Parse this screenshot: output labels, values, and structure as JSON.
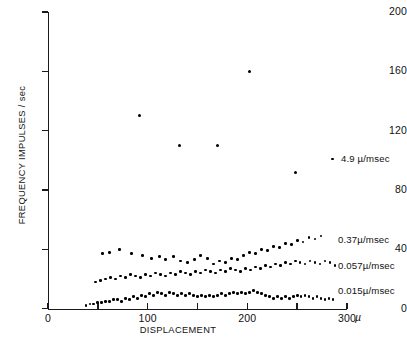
{
  "chart_data": {
    "type": "scatter",
    "title": "",
    "xlabel": "DISPLACEMENT",
    "ylabel": "FREQUENCY IMPULSES / sec",
    "xunit": "µ",
    "xlim": [
      0,
      300
    ],
    "ylim": [
      0,
      200
    ],
    "xticks": [
      0,
      50,
      100,
      150,
      200,
      250,
      300
    ],
    "xticklabels": [
      "0",
      "",
      "100",
      "",
      "200",
      "",
      "300"
    ],
    "yticks": [
      0,
      40,
      80,
      120,
      160,
      200
    ],
    "yticklabels": [
      "0",
      "40",
      "80",
      "120",
      "160",
      "200"
    ],
    "grid": false,
    "legend_position": "right-inline",
    "marker_color": "#000000",
    "series": [
      {
        "name": "4.9 µ/msec",
        "label": "4.9 µ/msec",
        "label_y": 101,
        "points": [
          [
            92,
            130
          ],
          [
            132,
            110
          ],
          [
            170,
            110
          ],
          [
            202,
            160
          ],
          [
            248,
            92
          ]
        ]
      },
      {
        "name": "0.37 µ/msec",
        "label": "0.37µ/msec",
        "label_y": 46,
        "points": [
          [
            55,
            37
          ],
          [
            62,
            38
          ],
          [
            72,
            40
          ],
          [
            84,
            37
          ],
          [
            95,
            36
          ],
          [
            104,
            34
          ],
          [
            112,
            35
          ],
          [
            118,
            33
          ],
          [
            126,
            35
          ],
          [
            133,
            32
          ],
          [
            140,
            31
          ],
          [
            147,
            33
          ],
          [
            153,
            36
          ],
          [
            160,
            34
          ],
          [
            166,
            30
          ],
          [
            172,
            32
          ],
          [
            178,
            31
          ],
          [
            184,
            34
          ],
          [
            190,
            33
          ],
          [
            196,
            36
          ],
          [
            202,
            38
          ],
          [
            208,
            37
          ],
          [
            214,
            40
          ],
          [
            220,
            39
          ],
          [
            226,
            42
          ],
          [
            232,
            41
          ],
          [
            238,
            44
          ],
          [
            244,
            43
          ],
          [
            250,
            46
          ],
          [
            256,
            45
          ],
          [
            262,
            48
          ],
          [
            268,
            47
          ],
          [
            274,
            49
          ]
        ]
      },
      {
        "name": "0.057 µ/msec",
        "label": "0.057µ/msec",
        "label_y": 29,
        "points": [
          [
            48,
            18
          ],
          [
            53,
            19
          ],
          [
            58,
            20
          ],
          [
            63,
            21
          ],
          [
            68,
            20
          ],
          [
            73,
            22
          ],
          [
            78,
            21
          ],
          [
            83,
            23
          ],
          [
            88,
            22
          ],
          [
            93,
            21
          ],
          [
            98,
            23
          ],
          [
            103,
            22
          ],
          [
            108,
            24
          ],
          [
            113,
            23
          ],
          [
            118,
            22
          ],
          [
            123,
            24
          ],
          [
            128,
            23
          ],
          [
            133,
            25
          ],
          [
            138,
            24
          ],
          [
            143,
            23
          ],
          [
            148,
            25
          ],
          [
            153,
            24
          ],
          [
            158,
            26
          ],
          [
            163,
            25
          ],
          [
            168,
            24
          ],
          [
            173,
            26
          ],
          [
            178,
            25
          ],
          [
            183,
            27
          ],
          [
            188,
            26
          ],
          [
            193,
            25
          ],
          [
            198,
            27
          ],
          [
            203,
            26
          ],
          [
            208,
            28
          ],
          [
            213,
            27
          ],
          [
            218,
            29
          ],
          [
            223,
            28
          ],
          [
            228,
            30
          ],
          [
            233,
            29
          ],
          [
            238,
            31
          ],
          [
            243,
            30
          ],
          [
            248,
            32
          ],
          [
            253,
            31
          ],
          [
            258,
            30
          ],
          [
            263,
            32
          ],
          [
            268,
            31
          ],
          [
            273,
            30
          ],
          [
            278,
            32
          ],
          [
            283,
            31
          ],
          [
            288,
            29
          ]
        ]
      },
      {
        "name": "0.015 µ/msec",
        "label": "0.015µ/msec",
        "label_y": 12,
        "points": [
          [
            38,
            2
          ],
          [
            42,
            3
          ],
          [
            46,
            3
          ],
          [
            50,
            4
          ],
          [
            54,
            4
          ],
          [
            58,
            5
          ],
          [
            62,
            5
          ],
          [
            66,
            6
          ],
          [
            70,
            6
          ],
          [
            74,
            5
          ],
          [
            78,
            7
          ],
          [
            82,
            6
          ],
          [
            86,
            8
          ],
          [
            90,
            7
          ],
          [
            94,
            9
          ],
          [
            98,
            8
          ],
          [
            102,
            10
          ],
          [
            106,
            9
          ],
          [
            110,
            11
          ],
          [
            114,
            10
          ],
          [
            118,
            9
          ],
          [
            122,
            11
          ],
          [
            126,
            10
          ],
          [
            130,
            9
          ],
          [
            134,
            10
          ],
          [
            138,
            9
          ],
          [
            142,
            10
          ],
          [
            146,
            9
          ],
          [
            150,
            8
          ],
          [
            154,
            9
          ],
          [
            158,
            8
          ],
          [
            162,
            9
          ],
          [
            166,
            8
          ],
          [
            170,
            9
          ],
          [
            174,
            10
          ],
          [
            178,
            9
          ],
          [
            182,
            10
          ],
          [
            186,
            11
          ],
          [
            190,
            10
          ],
          [
            194,
            11
          ],
          [
            198,
            10
          ],
          [
            202,
            11
          ],
          [
            206,
            12
          ],
          [
            210,
            11
          ],
          [
            214,
            10
          ],
          [
            218,
            9
          ],
          [
            222,
            8
          ],
          [
            226,
            7
          ],
          [
            230,
            8
          ],
          [
            234,
            7
          ],
          [
            238,
            8
          ],
          [
            242,
            7
          ],
          [
            246,
            8
          ],
          [
            250,
            9
          ],
          [
            254,
            8
          ],
          [
            258,
            9
          ],
          [
            262,
            8
          ],
          [
            266,
            7
          ],
          [
            270,
            8
          ],
          [
            274,
            7
          ],
          [
            278,
            6
          ],
          [
            282,
            7
          ],
          [
            286,
            6
          ]
        ]
      }
    ]
  }
}
